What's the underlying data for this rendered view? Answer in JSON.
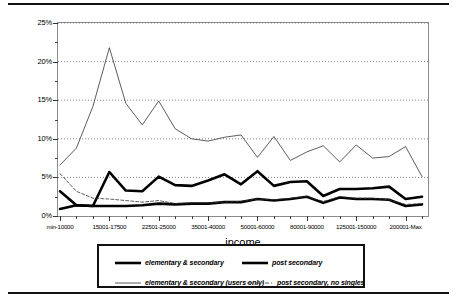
{
  "axes": {
    "xlabel": "income",
    "ylabel": "percent of post-fisc income",
    "yticks": [
      "0%",
      "5%",
      "10%",
      "15%",
      "20%",
      "25%"
    ],
    "xticklabels": [
      "min-10000",
      "15001-17500",
      "22501-25000",
      "35001-40000",
      "50001-60000",
      "80001-90000",
      "125001-150000",
      "200001-Max"
    ]
  },
  "legend": {
    "entries": [
      {
        "label": "elementary & secondary",
        "key": "bold-solid-line"
      },
      {
        "label": "post secondary",
        "key": "bold-solid-line"
      },
      {
        "label": "elementary & secondary (users only)",
        "key": "thin-solid-line"
      },
      {
        "label": "post secondary, no singles",
        "key": "thin-dashed-line"
      }
    ]
  },
  "chart_data": {
    "type": "line",
    "title": "",
    "xlabel": "income",
    "ylabel": "percent of post-fisc income",
    "ylim": [
      0,
      25
    ],
    "yticks": [
      0,
      5,
      10,
      15,
      20,
      25
    ],
    "grid": true,
    "grid_axis": "y",
    "legend_position": "bottom",
    "categories": [
      "min-10000",
      "10001-12500",
      "12501-15000",
      "15001-17500",
      "17501-20000",
      "20001-22500",
      "22501-25000",
      "25001-27500",
      "27501-30000",
      "30001-35000",
      "35001-40000",
      "40001-45000",
      "45001-50000",
      "50001-60000",
      "60001-70000",
      "70001-80000",
      "80001-90000",
      "90001-100000",
      "100001-125000",
      "125001-150000",
      "150001-175000",
      "175001-200000",
      "200001-Max"
    ],
    "series": [
      {
        "name": "elementary & secondary",
        "style": "bold-solid",
        "values": [
          3.2,
          1.4,
          1.3,
          5.7,
          3.3,
          3.2,
          5.1,
          4.0,
          3.9,
          4.6,
          5.4,
          4.1,
          5.8,
          3.9,
          4.4,
          4.5,
          2.6,
          3.5,
          3.5,
          3.6,
          3.8,
          2.2,
          2.5
        ]
      },
      {
        "name": "post secondary",
        "style": "bold-solid",
        "values": [
          0.9,
          1.4,
          1.3,
          1.3,
          1.3,
          1.4,
          1.6,
          1.5,
          1.6,
          1.6,
          1.8,
          1.8,
          2.2,
          2.0,
          2.2,
          2.5,
          1.7,
          2.4,
          2.2,
          2.2,
          2.1,
          1.3,
          1.5
        ]
      },
      {
        "name": "elementary & secondary (users only)",
        "style": "thin-solid",
        "values": [
          6.6,
          8.8,
          14.2,
          21.8,
          14.6,
          11.8,
          14.9,
          11.3,
          10.0,
          9.7,
          10.2,
          10.5,
          7.6,
          10.3,
          7.2,
          8.3,
          9.1,
          7.0,
          9.2,
          7.5,
          7.7,
          9.0,
          5.1
        ]
      },
      {
        "name": "post secondary, no singles",
        "style": "thin-dashed",
        "values": [
          5.5,
          3.2,
          2.3,
          2.2,
          2.0,
          1.8,
          2.0,
          1.6,
          1.7,
          1.7,
          1.8,
          1.9,
          2.2,
          2.1,
          2.3,
          2.5,
          1.9,
          2.5,
          2.3,
          2.3,
          2.1,
          1.5,
          1.6
        ]
      }
    ]
  }
}
